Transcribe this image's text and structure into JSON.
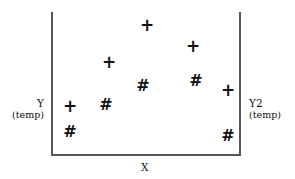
{
  "chart_data": {
    "type": "scatter",
    "title": "",
    "xlabel": "X",
    "ylabel": "Y",
    "ylabel_unit": "(temp)",
    "y2label": "Y2",
    "y2label_unit": "(temp)",
    "grid": false,
    "legend": null,
    "axis_ticks": "none",
    "series": [
      {
        "name": "plus",
        "marker": "+",
        "axis": "left",
        "points": [
          {
            "x": 10,
            "y": 34,
            "px": 70,
            "py": 106
          },
          {
            "x": 31,
            "y": 65,
            "px": 109,
            "py": 62
          },
          {
            "x": 51,
            "y": 91,
            "px": 147,
            "py": 25
          },
          {
            "x": 75,
            "y": 76,
            "px": 193,
            "py": 46
          },
          {
            "x": 94,
            "y": 45,
            "px": 228,
            "py": 90
          }
        ]
      },
      {
        "name": "hash",
        "marker": "#",
        "axis": "right",
        "points": [
          {
            "x": 10,
            "y": 17,
            "px": 70,
            "py": 131
          },
          {
            "x": 29,
            "y": 35,
            "px": 106,
            "py": 104
          },
          {
            "x": 49,
            "y": 49,
            "px": 143,
            "py": 85
          },
          {
            "x": 77,
            "y": 52,
            "px": 196,
            "py": 80
          },
          {
            "x": 94,
            "y": 14,
            "px": 228,
            "py": 135
          }
        ]
      }
    ],
    "xlim": [
      0,
      100
    ],
    "ylim": [
      0,
      100
    ]
  },
  "labels": {
    "y": "Y",
    "y_unit": "(temp)",
    "y2": "Y2",
    "y2_unit": "(temp)",
    "x": "X"
  }
}
